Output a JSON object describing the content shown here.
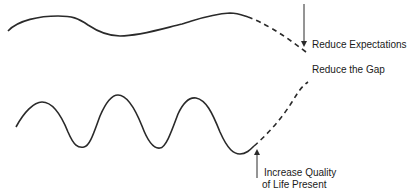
{
  "diagram": {
    "type": "gap-reduction-curves",
    "colors": {
      "line": "#2a2a2a",
      "text": "#1a1a1a",
      "background": "#ffffff"
    },
    "curves": [
      {
        "name": "expectations-curve",
        "style": "solid-then-dashed",
        "description": "upper gently undulating line descending (dashed) toward Reduce Expectations"
      },
      {
        "name": "quality-of-life-curve",
        "style": "solid-then-dashed",
        "description": "lower oscillating line rising (dashed) from trough toward Reduce the Gap"
      }
    ],
    "labels": {
      "reduce_expectations": "Reduce Expectations",
      "reduce_gap": "Reduce the Gap",
      "increase_quality_line1": "Increase Quality",
      "increase_quality_line2": "of Life Present"
    },
    "arrows": [
      {
        "name": "down-arrow",
        "direction": "down",
        "points_to": "end of upper dashed curve"
      },
      {
        "name": "up-arrow",
        "direction": "up",
        "points_to": "trough of lower curve"
      }
    ]
  }
}
